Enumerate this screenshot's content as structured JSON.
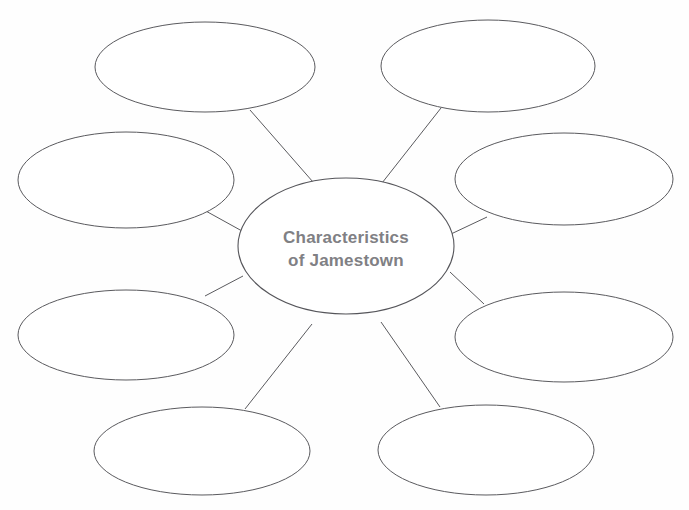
{
  "document": {
    "type": "graphic-organizer",
    "layout": "concept-web",
    "background_color": "#fefefe",
    "stroke_color": "#5a5a5e",
    "text_color": "#808084"
  },
  "center": {
    "label_line1": "Characteristics",
    "label_line2": "of Jamestown",
    "cx": 346,
    "cy": 246,
    "rx": 108,
    "ry": 68
  },
  "nodes": [
    {
      "id": "node-top-left",
      "label": "",
      "cx": 205,
      "cy": 67,
      "rx": 110,
      "ry": 45
    },
    {
      "id": "node-top-right",
      "label": "",
      "cx": 488,
      "cy": 66,
      "rx": 107,
      "ry": 46
    },
    {
      "id": "node-middle-left",
      "label": "",
      "cx": 126,
      "cy": 180,
      "rx": 108,
      "ry": 48
    },
    {
      "id": "node-middle-right",
      "label": "",
      "cx": 564,
      "cy": 179,
      "rx": 109,
      "ry": 46
    },
    {
      "id": "node-lower-left",
      "label": "",
      "cx": 126,
      "cy": 335,
      "rx": 108,
      "ry": 45
    },
    {
      "id": "node-lower-right",
      "label": "",
      "cx": 564,
      "cy": 337,
      "rx": 109,
      "ry": 45
    },
    {
      "id": "node-bottom-left",
      "label": "",
      "cx": 202,
      "cy": 451,
      "rx": 108,
      "ry": 44
    },
    {
      "id": "node-bottom-right",
      "label": "",
      "cx": 486,
      "cy": 450,
      "rx": 108,
      "ry": 45
    }
  ],
  "connectors": [
    {
      "id": "connector-top-left",
      "x1": 250,
      "y1": 110,
      "x2": 313,
      "y2": 182
    },
    {
      "id": "connector-top-right",
      "x1": 441,
      "y1": 108,
      "x2": 382,
      "y2": 183
    },
    {
      "id": "connector-middle-left",
      "x1": 204,
      "y1": 210,
      "x2": 242,
      "y2": 231
    },
    {
      "id": "connector-middle-right",
      "x1": 487,
      "y1": 217,
      "x2": 451,
      "y2": 234
    },
    {
      "id": "connector-lower-left",
      "x1": 205,
      "y1": 296,
      "x2": 243,
      "y2": 276
    },
    {
      "id": "connector-lower-right",
      "x1": 484,
      "y1": 304,
      "x2": 450,
      "y2": 272
    },
    {
      "id": "connector-bottom-left",
      "x1": 245,
      "y1": 409,
      "x2": 312,
      "y2": 324
    },
    {
      "id": "connector-bottom-right",
      "x1": 440,
      "y1": 407,
      "x2": 381,
      "y2": 322
    }
  ]
}
